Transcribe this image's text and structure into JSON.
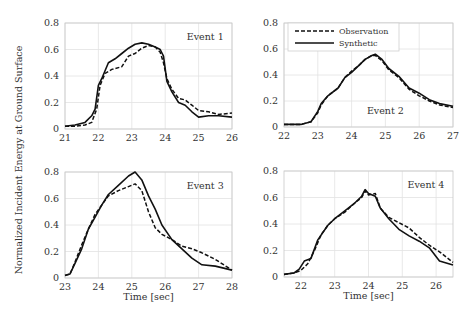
{
  "figure": {
    "ylabel": "Normalized Incident Energy at Ground Surface",
    "legend": {
      "observation": "Observation",
      "synthetic": "Synthetic"
    }
  },
  "chart_data": [
    {
      "type": "line",
      "title": "Event 1",
      "xlabel": "",
      "ylabel": "Normalized Incident Energy at Ground Surface",
      "xlim": [
        21,
        26
      ],
      "ylim": [
        0,
        0.8
      ],
      "xticks": [
        21,
        22,
        23,
        24,
        25,
        26
      ],
      "yticks": [
        0,
        0.2,
        0.4,
        0.6,
        0.8
      ],
      "grid": true,
      "series": [
        {
          "name": "Observation",
          "style": "dashed",
          "x": [
            21,
            21.3,
            21.6,
            21.8,
            21.95,
            22.05,
            22.2,
            22.4,
            22.7,
            22.9,
            23.1,
            23.3,
            23.5,
            23.7,
            23.85,
            23.95,
            24.05,
            24.2,
            24.4,
            24.6,
            24.8,
            25.0,
            25.3,
            25.6,
            26
          ],
          "y": [
            0.02,
            0.02,
            0.03,
            0.05,
            0.15,
            0.33,
            0.42,
            0.45,
            0.47,
            0.55,
            0.57,
            0.61,
            0.63,
            0.62,
            0.58,
            0.5,
            0.38,
            0.3,
            0.23,
            0.22,
            0.18,
            0.14,
            0.13,
            0.11,
            0.12
          ]
        },
        {
          "name": "Synthetic",
          "style": "solid",
          "x": [
            21,
            21.3,
            21.6,
            21.8,
            21.9,
            22.0,
            22.1,
            22.3,
            22.5,
            22.7,
            22.9,
            23.1,
            23.3,
            23.5,
            23.7,
            23.85,
            23.95,
            24.05,
            24.2,
            24.4,
            24.6,
            24.8,
            25.0,
            25.3,
            25.6,
            26
          ],
          "y": [
            0.02,
            0.03,
            0.05,
            0.1,
            0.15,
            0.33,
            0.38,
            0.5,
            0.53,
            0.57,
            0.61,
            0.64,
            0.65,
            0.64,
            0.62,
            0.6,
            0.55,
            0.36,
            0.28,
            0.2,
            0.18,
            0.13,
            0.09,
            0.1,
            0.1,
            0.09
          ]
        }
      ]
    },
    {
      "type": "line",
      "title": "Event 2",
      "xlabel": "",
      "xlim": [
        22,
        27
      ],
      "ylim": [
        0,
        0.8
      ],
      "xticks": [
        22,
        23,
        24,
        25,
        26,
        27
      ],
      "yticks": [
        0,
        0.2,
        0.4,
        0.6,
        0.8
      ],
      "grid": true,
      "legend": {
        "position": "upper left",
        "entries": [
          "Observation",
          "Synthetic"
        ]
      },
      "series": [
        {
          "name": "Observation",
          "style": "dashed",
          "x": [
            22,
            22.5,
            22.8,
            23.0,
            23.1,
            23.3,
            23.6,
            23.8,
            24.0,
            24.2,
            24.4,
            24.6,
            24.7,
            24.9,
            25.1,
            25.4,
            25.7,
            26.0,
            26.3,
            26.6,
            27
          ],
          "y": [
            0.02,
            0.02,
            0.04,
            0.11,
            0.17,
            0.24,
            0.3,
            0.38,
            0.43,
            0.47,
            0.52,
            0.55,
            0.55,
            0.51,
            0.44,
            0.38,
            0.29,
            0.24,
            0.2,
            0.17,
            0.15
          ]
        },
        {
          "name": "Synthetic",
          "style": "solid",
          "x": [
            22,
            22.5,
            22.8,
            23.0,
            23.1,
            23.3,
            23.6,
            23.8,
            24.0,
            24.2,
            24.4,
            24.6,
            24.7,
            24.9,
            25.1,
            25.4,
            25.7,
            26.0,
            26.3,
            26.6,
            27
          ],
          "y": [
            0.02,
            0.02,
            0.04,
            0.12,
            0.18,
            0.24,
            0.3,
            0.38,
            0.42,
            0.47,
            0.52,
            0.55,
            0.56,
            0.52,
            0.45,
            0.39,
            0.3,
            0.26,
            0.21,
            0.18,
            0.16
          ]
        }
      ]
    },
    {
      "type": "line",
      "title": "Event 3",
      "xlabel": "Time [sec]",
      "xlim": [
        23,
        28
      ],
      "ylim": [
        0,
        0.8
      ],
      "xticks": [
        23,
        24,
        25,
        26,
        27,
        28
      ],
      "yticks": [
        0,
        0.2,
        0.4,
        0.6,
        0.8
      ],
      "grid": true,
      "series": [
        {
          "name": "Observation",
          "style": "dashed",
          "x": [
            23,
            23.15,
            23.3,
            23.5,
            23.7,
            23.9,
            24.1,
            24.3,
            24.6,
            24.9,
            25.1,
            25.3,
            25.5,
            25.7,
            25.9,
            26.2,
            26.5,
            26.8,
            27.1,
            27.5,
            28
          ],
          "y": [
            0.02,
            0.03,
            0.12,
            0.25,
            0.37,
            0.48,
            0.55,
            0.62,
            0.66,
            0.69,
            0.71,
            0.66,
            0.5,
            0.38,
            0.33,
            0.29,
            0.24,
            0.22,
            0.19,
            0.14,
            0.06
          ]
        },
        {
          "name": "Synthetic",
          "style": "solid",
          "x": [
            23,
            23.15,
            23.3,
            23.5,
            23.7,
            23.9,
            24.1,
            24.3,
            24.6,
            24.9,
            25.1,
            25.3,
            25.5,
            25.7,
            25.9,
            26.2,
            26.5,
            26.8,
            27.1,
            27.5,
            28
          ],
          "y": [
            0.02,
            0.03,
            0.11,
            0.22,
            0.37,
            0.46,
            0.55,
            0.63,
            0.7,
            0.77,
            0.8,
            0.74,
            0.62,
            0.52,
            0.4,
            0.29,
            0.22,
            0.15,
            0.1,
            0.09,
            0.06
          ]
        }
      ]
    },
    {
      "type": "line",
      "title": "Event 4",
      "xlabel": "Time [sec]",
      "xlim": [
        21.5,
        26.5
      ],
      "ylim": [
        0,
        0.8
      ],
      "xticks": [
        22,
        23,
        24,
        25,
        26
      ],
      "yticks": [
        0,
        0.2,
        0.4,
        0.6,
        0.8
      ],
      "grid": true,
      "series": [
        {
          "name": "Observation",
          "style": "dashed",
          "x": [
            21.5,
            21.8,
            22.0,
            22.2,
            22.4,
            22.6,
            22.8,
            23.0,
            23.3,
            23.6,
            23.8,
            23.9,
            24.0,
            24.2,
            24.35,
            24.6,
            24.9,
            25.2,
            25.5,
            25.8,
            26.1,
            26.5
          ],
          "y": [
            0.02,
            0.03,
            0.05,
            0.1,
            0.2,
            0.32,
            0.39,
            0.44,
            0.49,
            0.56,
            0.6,
            0.65,
            0.62,
            0.63,
            0.52,
            0.45,
            0.41,
            0.37,
            0.3,
            0.24,
            0.19,
            0.11
          ]
        },
        {
          "name": "Synthetic",
          "style": "solid",
          "x": [
            21.5,
            21.8,
            21.95,
            22.1,
            22.3,
            22.5,
            22.8,
            23.0,
            23.3,
            23.6,
            23.8,
            23.9,
            24.0,
            24.2,
            24.35,
            24.6,
            24.9,
            25.2,
            25.5,
            25.8,
            26.1,
            26.5
          ],
          "y": [
            0.02,
            0.03,
            0.06,
            0.12,
            0.14,
            0.28,
            0.39,
            0.44,
            0.5,
            0.56,
            0.61,
            0.66,
            0.63,
            0.61,
            0.52,
            0.44,
            0.36,
            0.31,
            0.27,
            0.22,
            0.12,
            0.09
          ]
        }
      ]
    }
  ],
  "panels": [
    {
      "box": [
        65,
        23,
        232,
        129
      ]
    },
    {
      "box": [
        284,
        23,
        453,
        127
      ]
    },
    {
      "box": [
        65,
        172,
        232,
        278
      ]
    },
    {
      "box": [
        284,
        171,
        453,
        277
      ]
    }
  ]
}
